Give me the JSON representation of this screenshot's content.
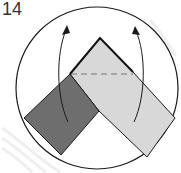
{
  "diagram": {
    "step_number": "14",
    "colors": {
      "background": "#ffffff",
      "outline": "#1a1a1a",
      "dark_strip": "#6e6e6e",
      "light_strip": "#d8d8d8",
      "dashed_line": "#777777",
      "watermark": "#f0f0f0"
    },
    "circle": {
      "cx": 97,
      "cy": 88,
      "r": 81
    },
    "shapes": {
      "light_strip": "100,38 133,72 175,118 147,157 99,111 70,74",
      "dark_strip": "70,74 99,111 61,155 24,118",
      "apex_edge": "70,74 100,38 133,72",
      "dashed_crease": {
        "x1": 71,
        "y1": 74,
        "x2": 133,
        "y2": 74
      }
    },
    "arrows": [
      {
        "name": "left-fold-arrow",
        "path": "M68,122 C56,96 56,54 67,28",
        "head": "67,26"
      },
      {
        "name": "right-fold-arrow",
        "path": "M134,122 C146,96 146,54 135,29",
        "head": "135,27"
      }
    ]
  }
}
